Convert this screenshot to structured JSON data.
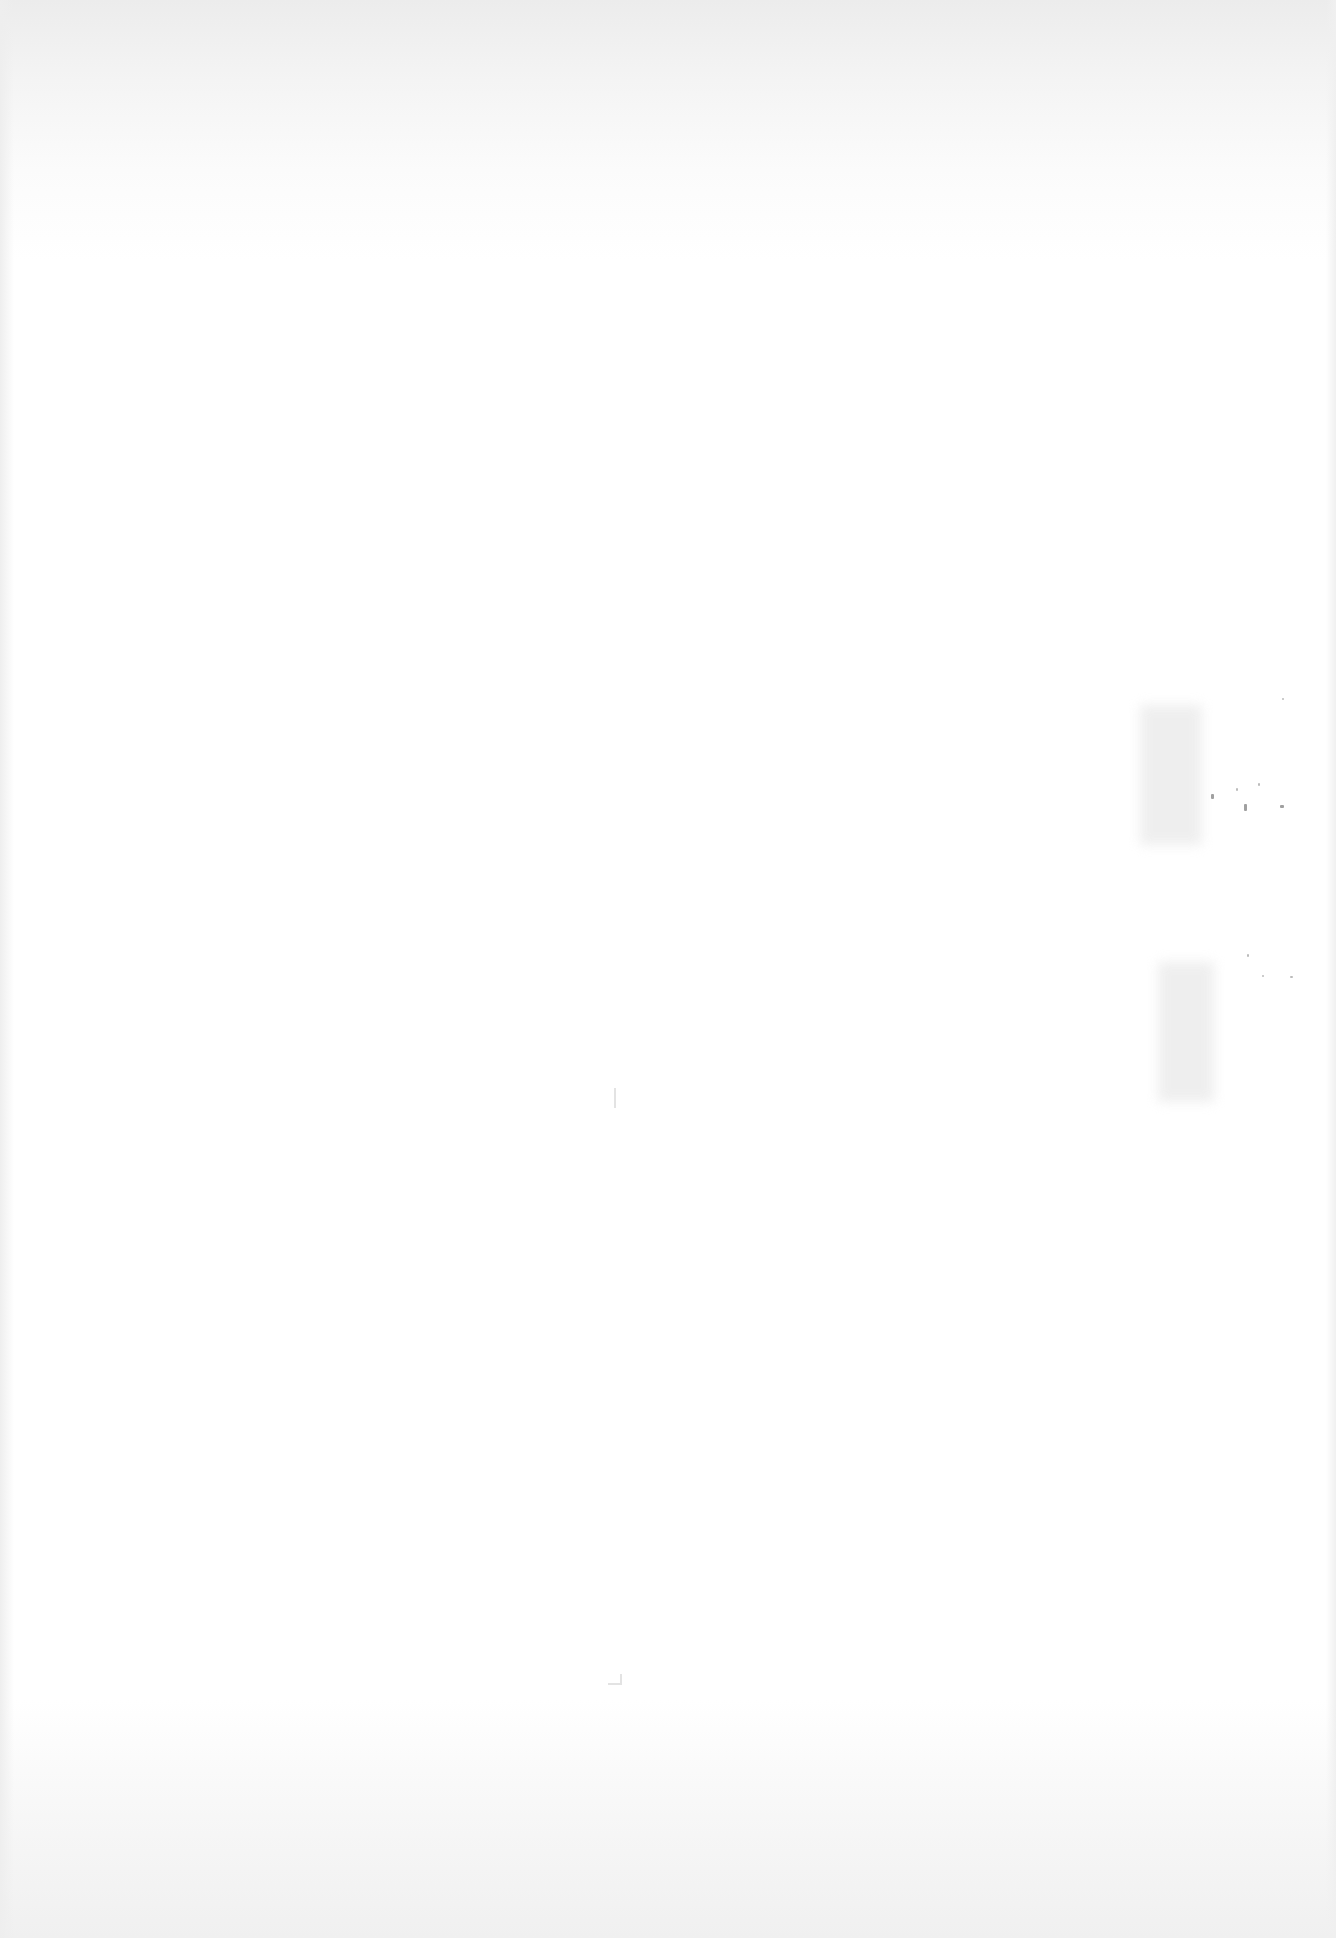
{
  "document": {
    "type": "scanned-page",
    "content": "",
    "colors": {
      "paper": "#ffffff",
      "scan_shadow": "#ececec",
      "speckle": "#777777"
    }
  }
}
